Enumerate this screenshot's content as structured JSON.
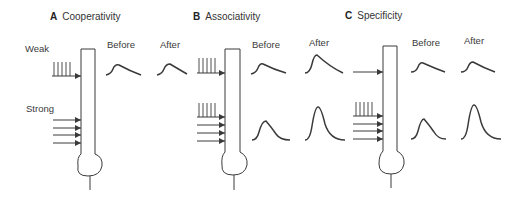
{
  "panels": [
    {
      "letter": "A",
      "title": "Cooperativity",
      "weak_label": "Weak",
      "strong_label": "Strong",
      "before_label": "Before",
      "after_label": "After",
      "weak_row": {
        "before": "small",
        "after": "small"
      }
    },
    {
      "letter": "B",
      "title": "Associativity",
      "before_label": "Before",
      "after_label": "After",
      "weak_row": {
        "before": "small",
        "after": "large"
      },
      "strong_row": {
        "before": "medium",
        "after": "large"
      }
    },
    {
      "letter": "C",
      "title": "Specificity",
      "before_label": "Before",
      "after_label": "After",
      "weak_row": {
        "before": "small",
        "after": "small"
      },
      "strong_row": {
        "before": "medium",
        "after": "large"
      }
    }
  ],
  "colors": {
    "ink": "#3a3a3a",
    "background": "#ffffff"
  }
}
